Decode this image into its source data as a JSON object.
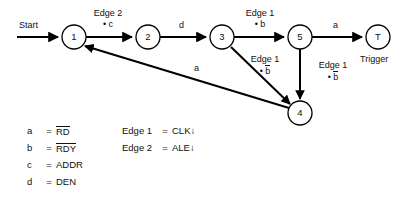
{
  "diagram": {
    "start_label": "Start",
    "nodes": [
      {
        "id": "1",
        "label": "1",
        "x": 74,
        "y": 37,
        "r": 12
      },
      {
        "id": "2",
        "label": "2",
        "x": 148,
        "y": 37,
        "r": 12
      },
      {
        "id": "3",
        "label": "3",
        "x": 222,
        "y": 37,
        "r": 12
      },
      {
        "id": "5",
        "label": "5",
        "x": 300,
        "y": 37,
        "r": 12
      },
      {
        "id": "T",
        "label": "T",
        "x": 378,
        "y": 37,
        "r": 12,
        "caption": "Trigger"
      },
      {
        "id": "4",
        "label": "4",
        "x": 300,
        "y": 113,
        "r": 12
      }
    ],
    "transitions": [
      {
        "from": "start",
        "to": "1",
        "label_line1": "Start",
        "label_line2": ""
      },
      {
        "from": "1",
        "to": "2",
        "label_line1": "Edge 2",
        "label_line2": "• c",
        "overline2": false
      },
      {
        "from": "2",
        "to": "3",
        "label_line1": "d",
        "label_line2": "",
        "overline2": false
      },
      {
        "from": "3",
        "to": "5",
        "label_line1": "Edge 1",
        "label_line2": "• b",
        "overline2": false
      },
      {
        "from": "5",
        "to": "T",
        "label_line1": "a",
        "label_line2": "",
        "overline2": false
      },
      {
        "from": "3",
        "to": "4",
        "label_line1": "Edge 1",
        "label_line2": "b",
        "label2_prefix": "• ",
        "overline2": true
      },
      {
        "from": "5",
        "to": "4",
        "label_line1": "Edge 1",
        "label_line2": "b",
        "label2_prefix": "• ",
        "overline2": true
      },
      {
        "from": "4",
        "to": "1",
        "label_line1": "a",
        "label_line2": "",
        "overline2": false
      }
    ]
  },
  "legend": {
    "signals": [
      {
        "key": "a",
        "eq": "=",
        "value": "RD",
        "overline": true
      },
      {
        "key": "b",
        "eq": "=",
        "value": "RDY",
        "overline": true
      },
      {
        "key": "c",
        "eq": "=",
        "value": "ADDR",
        "overline": false
      },
      {
        "key": "d",
        "eq": "=",
        "value": "DEN",
        "overline": false
      }
    ],
    "edges": [
      {
        "key": "Edge 1",
        "eq": "=",
        "value": "CLK↓"
      },
      {
        "key": "Edge 2",
        "eq": "=",
        "value": "ALE↓"
      }
    ]
  }
}
